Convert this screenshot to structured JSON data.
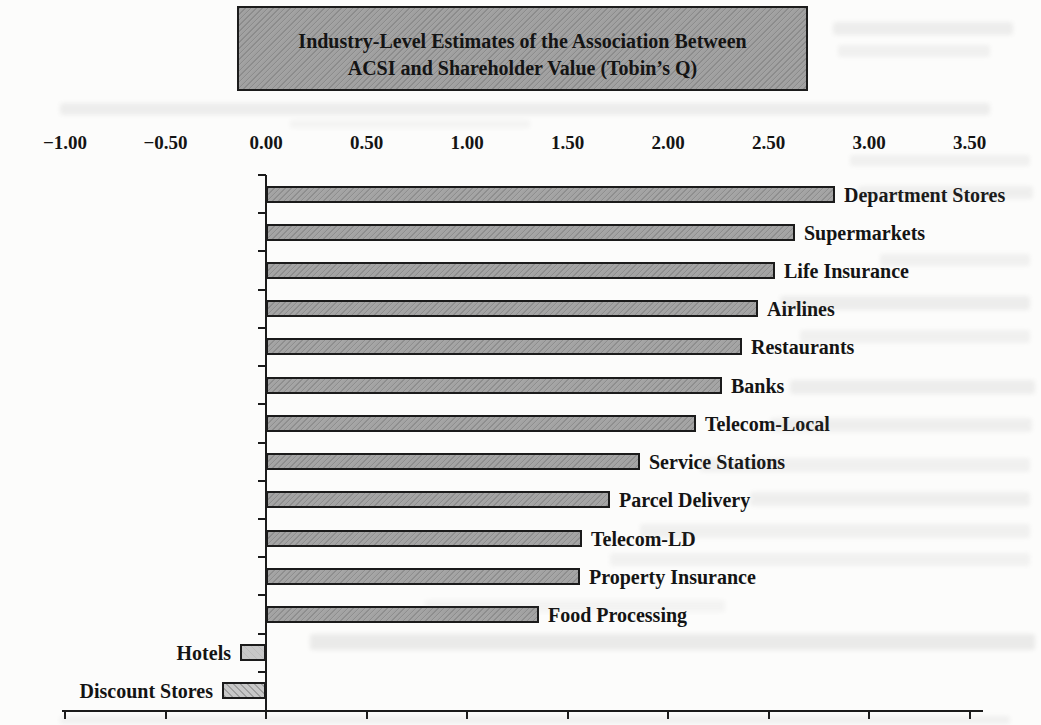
{
  "title_box": {
    "line1": "Industry-Level Estimates of the Association Between",
    "line2": "ACSI and Shareholder Value (Tobin’s Q)"
  },
  "chart_data": {
    "type": "bar",
    "orientation": "horizontal",
    "categories": [
      "Department Stores",
      "Supermarkets",
      "Life Insurance",
      "Airlines",
      "Restaurants",
      "Banks",
      "Telecom-Local",
      "Service Stations",
      "Parcel Delivery",
      "Telecom-LD",
      "Property Insurance",
      "Food Processing",
      "Hotels",
      "Discount Stores"
    ],
    "values": [
      2.83,
      2.63,
      2.53,
      2.45,
      2.37,
      2.27,
      2.14,
      1.86,
      1.71,
      1.57,
      1.56,
      1.36,
      -0.13,
      -0.22
    ],
    "bar_patterns": [
      "halftone",
      "halftone",
      "halftone",
      "halftone",
      "halftone",
      "halftone",
      "halftone",
      "halftone",
      "halftone",
      "halftone",
      "halftone",
      "halftone",
      "plain",
      "diagonal-stripe"
    ],
    "xlabel": "",
    "ylabel": "",
    "xlim": [
      -1.0,
      3.5
    ],
    "x_axis": {
      "position": "top",
      "tick_values": [
        -1.0,
        -0.5,
        0.0,
        0.5,
        1.0,
        1.5,
        2.0,
        2.5,
        3.0,
        3.5
      ],
      "tick_labels": [
        "−1.00",
        "−0.50",
        "0.00",
        "0.50",
        "1.00",
        "1.50",
        "2.00",
        "2.50",
        "3.00",
        "3.50"
      ]
    },
    "grid": false,
    "legend": false,
    "colors": {
      "bar_fill": "#a2a2a2",
      "bar_fill_negative": "#c8c8c8",
      "bar_border": "#1b1b1b",
      "title_box_fill": "#9f9f9f",
      "title_box_border": "#1c1c1c",
      "axis_color": "#1b1b1b",
      "text_color": "#141414",
      "page_background": "#fcfcfb"
    }
  }
}
